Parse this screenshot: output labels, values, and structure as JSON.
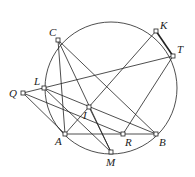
{
  "diagram": {
    "circle": {
      "cx": 111,
      "cy": 88,
      "r": 66
    },
    "points": [
      {
        "name": "C",
        "x": 58,
        "y": 40,
        "lx": 49,
        "ly": 36
      },
      {
        "name": "K",
        "x": 156,
        "y": 31,
        "lx": 160,
        "ly": 29
      },
      {
        "name": "T",
        "x": 173,
        "y": 56,
        "lx": 177,
        "ly": 53
      },
      {
        "name": "L",
        "x": 44,
        "y": 88,
        "lx": 34,
        "ly": 85
      },
      {
        "name": "Q",
        "x": 23,
        "y": 93,
        "lx": 9,
        "ly": 97
      },
      {
        "name": "I",
        "x": 89,
        "y": 107,
        "lx": 83,
        "ly": 119
      },
      {
        "name": "A",
        "x": 65,
        "y": 134,
        "lx": 55,
        "ly": 145
      },
      {
        "name": "R",
        "x": 123,
        "y": 134,
        "lx": 125,
        "ly": 146
      },
      {
        "name": "B",
        "x": 156,
        "y": 134,
        "lx": 159,
        "ly": 146
      },
      {
        "name": "M",
        "x": 111,
        "y": 152,
        "lx": 106,
        "ly": 166
      }
    ],
    "segments": [
      [
        "C",
        "A"
      ],
      [
        "C",
        "B"
      ],
      [
        "C",
        "M"
      ],
      [
        "A",
        "B"
      ],
      [
        "A",
        "K"
      ],
      [
        "R",
        "T"
      ],
      [
        "Q",
        "T"
      ],
      [
        "Q",
        "A"
      ],
      [
        "Q",
        "R"
      ],
      [
        "L",
        "B"
      ],
      [
        "L",
        "M"
      ],
      [
        "I",
        "M"
      ]
    ],
    "thick_segments": [
      [
        "K",
        "T"
      ]
    ]
  }
}
